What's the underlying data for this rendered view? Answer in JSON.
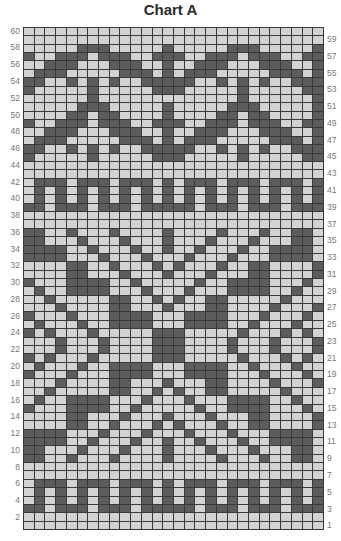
{
  "title": "Chart A",
  "chart_data": {
    "type": "heatmap",
    "title": "Chart A",
    "columns": 28,
    "rows_count": 60,
    "left_labels": [
      60,
      58,
      56,
      54,
      52,
      50,
      48,
      46,
      44,
      42,
      40,
      38,
      36,
      34,
      32,
      30,
      28,
      26,
      24,
      22,
      20,
      18,
      16,
      14,
      12,
      10,
      8,
      6,
      4,
      2
    ],
    "right_labels": [
      59,
      57,
      55,
      53,
      51,
      49,
      47,
      45,
      43,
      41,
      39,
      37,
      35,
      33,
      31,
      29,
      27,
      25,
      23,
      21,
      19,
      17,
      15,
      13,
      11,
      9,
      7,
      5,
      3,
      1
    ],
    "legend": {
      "#": "contrast color (dark)",
      ".": "main color (light)"
    },
    "rows": {
      "60": "............................",
      "59": "............................",
      "58": ".....###.....#.....###.....#",
      "57": "#..###.###..###..###.###..##",
      "56": "..###...###..#..###...###..#",
      "55": ".###.....###.#.###.....###.#",
      "54": "##..#.#.#..#####..#.#.#..###",
      "53": "#.....#.....###.....#.....##",
      "52": "......#.............#......#",
      "51": ".....###.....#.....###.....#",
      "50": "....##.##....#....##.##....#",
      "49": "#..###.###..###..###.###..##",
      "48": "..###...###..#..###...###..#",
      "47": ".###.....###.#.###.....###.#",
      "46": "##..#.#.#..#####..#.#.#..###",
      "45": "#.....#.....###.....#.....##",
      "44": "............................",
      "43": "............................",
      "42": ".###.###.###.#.###.###.###.#",
      "41": ".#.#.#.#.#.#.#.#.#.#.#.#.#.#",
      "40": ".#.#.#.#.#.#.#.#.#.#.#.#.#.#",
      "39": "##.###.###.#####.###.###.###",
      "38": "............................",
      "37": "............................",
      "36": "##..#...#....#....#...#..##.",
      "35": "##...#...#...#...#...#...##.",
      "34": "####..#...#..#..#...#..####.",
      "33": "####...#...#...#...#...####.",
      "32": "....##..#...#.#...#..##....#",
      "31": "....##...#...#...#...##....#",
      "30": "#...####..#.....#..####...#.",
      "29": ".#..####...#...#...####..#..",
      "28": "..#.....##..#.#..##.....#...",
      "27": "...#....##...#...##....#...#",
      "26": "#...#...####...####...#...#.",
      "25": ".#...#..####...####..#...#..",
      "24": "#.#...#.....###.....#...#.#.",
      "23": "...#...#....###....#...#...#",
      "22": "...#...#....###....#...#...#",
      "21": "#.#...#.....###.....#...#.#.",
      "20": ".#...#..####...####..#...#..",
      "19": "#...#...####...####...#...#.",
      "18": "...#....##...#...##....#...#",
      "17": "..#.....##..#.#..##.....#...",
      "16": ".#..####...#...#...####..#..",
      "15": "#...####..#.....#..####...#.",
      "14": "....##...#...#...#...##....#",
      "13": "....##..#...#.#...#..##....#",
      "12": "####...#...#...#...#...####.",
      "11": "####..#...#..#..#...#..####.",
      "10": "##...#...#...#...#...#...##.",
      "9": "##..#...#....#....#...#..##.",
      "8": "............................",
      "7": "............................",
      "6": ".###.###.###.#.###.###.###.#",
      "5": ".#.#.#.#.#.#.#.#.#.#.#.#.#.#",
      "4": ".#.#.#.#.#.#.#.#.#.#.#.#.#.#",
      "3": "##.###.###.#####.###.###.###",
      "2": "............................",
      "1": "............................"
    }
  },
  "colors": {
    "dark": "#5c5c5c",
    "light": "#d3d3d3",
    "gridline": "#3a3a3a"
  }
}
